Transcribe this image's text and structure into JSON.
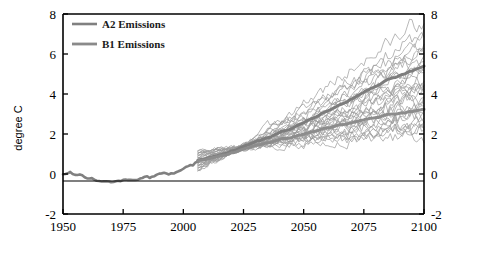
{
  "chart_data": {
    "type": "line",
    "title": "",
    "subtitle": "",
    "xlabel": "",
    "ylabel": "degree C",
    "xlim": [
      1950,
      2100
    ],
    "ylim": [
      -2,
      8
    ],
    "xticks": [
      1950,
      1975,
      2000,
      2025,
      2050,
      2075,
      2100
    ],
    "yticks": [
      -2,
      0,
      2,
      4,
      6,
      8
    ],
    "yticks_right": [
      -2,
      0,
      2,
      4,
      6,
      8
    ],
    "grid": false,
    "zero_line": 0,
    "legend_position": "top-left",
    "legend": [
      {
        "label": "A2 Emissions",
        "color": "#808080"
      },
      {
        "label": "B1 Emissions",
        "color": "#8a8a8a"
      }
    ],
    "annotations": [],
    "series": [
      {
        "name": "Historical observed/simulated",
        "role": "historical-mean",
        "color": "#808080",
        "width": 2.6,
        "x": [
          1950,
          1953,
          1956,
          1959,
          1962,
          1965,
          1968,
          1971,
          1974,
          1977,
          1980,
          1983,
          1986,
          1989,
          1992,
          1995,
          1998,
          2001,
          2004,
          2006
        ],
        "y": [
          0.02,
          0.06,
          -0.02,
          -0.12,
          -0.2,
          -0.3,
          -0.26,
          -0.34,
          -0.42,
          -0.28,
          -0.3,
          -0.14,
          -0.18,
          -0.05,
          0.04,
          0.02,
          0.12,
          0.3,
          0.44,
          0.62
        ]
      },
      {
        "name": "A2 Emissions",
        "role": "ensemble-mean",
        "color": "#7d7d7d",
        "width": 3.0,
        "x": [
          2006,
          2015,
          2025,
          2035,
          2045,
          2055,
          2065,
          2075,
          2085,
          2095,
          2100
        ],
        "y": [
          0.66,
          0.95,
          1.35,
          1.8,
          2.3,
          2.85,
          3.45,
          4.1,
          4.7,
          5.15,
          5.35
        ]
      },
      {
        "name": "B1 Emissions",
        "role": "ensemble-mean",
        "color": "#8c8c8c",
        "width": 3.0,
        "x": [
          2006,
          2015,
          2025,
          2035,
          2045,
          2055,
          2065,
          2075,
          2085,
          2095,
          2100
        ],
        "y": [
          0.64,
          0.9,
          1.22,
          1.55,
          1.85,
          2.15,
          2.45,
          2.72,
          2.95,
          3.12,
          3.2
        ]
      }
    ],
    "ensemble": {
      "description": "Individual model runs, thin grey lines, diverging after 2006",
      "color": "#9a9a9a",
      "width": 0.7,
      "start_year": 2006,
      "end_year": 2100,
      "start_value_range": [
        0.2,
        1.2
      ],
      "end_value_range": [
        1.8,
        7.8
      ],
      "member_count": 30,
      "members": [
        {
          "end": 7.8,
          "noise": 0.3,
          "seed": 3
        },
        {
          "end": 7.1,
          "noise": 0.26,
          "seed": 11
        },
        {
          "end": 6.8,
          "noise": 0.32,
          "seed": 19
        },
        {
          "end": 6.5,
          "noise": 0.22,
          "seed": 27
        },
        {
          "end": 6.2,
          "noise": 0.28,
          "seed": 35
        },
        {
          "end": 6.0,
          "noise": 0.24,
          "seed": 43
        },
        {
          "end": 5.8,
          "noise": 0.3,
          "seed": 51
        },
        {
          "end": 5.6,
          "noise": 0.2,
          "seed": 59
        },
        {
          "end": 5.4,
          "noise": 0.27,
          "seed": 67
        },
        {
          "end": 5.2,
          "noise": 0.23,
          "seed": 75
        },
        {
          "end": 5.0,
          "noise": 0.31,
          "seed": 83
        },
        {
          "end": 4.8,
          "noise": 0.25,
          "seed": 91
        },
        {
          "end": 4.6,
          "noise": 0.21,
          "seed": 99
        },
        {
          "end": 4.45,
          "noise": 0.29,
          "seed": 107
        },
        {
          "end": 4.3,
          "noise": 0.24,
          "seed": 115
        },
        {
          "end": 4.15,
          "noise": 0.26,
          "seed": 123
        },
        {
          "end": 4.0,
          "noise": 0.22,
          "seed": 131
        },
        {
          "end": 3.85,
          "noise": 0.3,
          "seed": 139
        },
        {
          "end": 3.7,
          "noise": 0.25,
          "seed": 147
        },
        {
          "end": 3.55,
          "noise": 0.2,
          "seed": 155
        },
        {
          "end": 3.4,
          "noise": 0.28,
          "seed": 163
        },
        {
          "end": 3.25,
          "noise": 0.23,
          "seed": 171
        },
        {
          "end": 3.1,
          "noise": 0.26,
          "seed": 179
        },
        {
          "end": 2.95,
          "noise": 0.21,
          "seed": 187
        },
        {
          "end": 2.8,
          "noise": 0.29,
          "seed": 195
        },
        {
          "end": 2.6,
          "noise": 0.24,
          "seed": 203
        },
        {
          "end": 2.45,
          "noise": 0.27,
          "seed": 211
        },
        {
          "end": 2.3,
          "noise": 0.22,
          "seed": 219
        },
        {
          "end": 2.1,
          "noise": 0.25,
          "seed": 227
        },
        {
          "end": 1.85,
          "noise": 0.23,
          "seed": 235
        }
      ]
    }
  },
  "axes": {
    "left_label": "degree C",
    "x_tick_labels": [
      "1950",
      "1975",
      "2000",
      "2025",
      "2050",
      "2075",
      "2100"
    ],
    "y_tick_labels": [
      "-2",
      "0",
      "2",
      "4",
      "6",
      "8"
    ],
    "y_tick_labels_right": [
      "-2",
      "0",
      "2",
      "4",
      "6",
      "8"
    ]
  },
  "legend": {
    "items": [
      {
        "label": "A2 Emissions"
      },
      {
        "label": "B1 Emissions"
      }
    ]
  }
}
